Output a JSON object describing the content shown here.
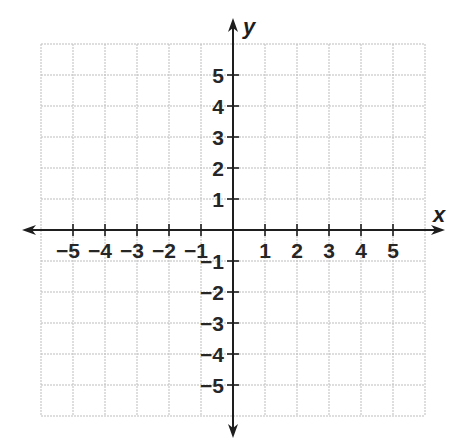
{
  "chart_data": {
    "type": "coordinate-plane",
    "title": "",
    "xlabel": "x",
    "ylabel": "y",
    "xlim": [
      -6,
      6
    ],
    "ylim": [
      -6,
      6
    ],
    "grid": true,
    "x_ticks": [
      -5,
      -4,
      -3,
      -2,
      -1,
      1,
      2,
      3,
      4,
      5
    ],
    "y_ticks": [
      -5,
      -4,
      -3,
      -2,
      -1,
      1,
      2,
      3,
      4,
      5
    ],
    "x_tick_labels": [
      "−5",
      "−4",
      "−3",
      "−2",
      "−1",
      "1",
      "2",
      "3",
      "4",
      "5"
    ],
    "y_tick_labels": [
      "−5",
      "−4",
      "−3",
      "−2",
      "−1",
      "1",
      "2",
      "3",
      "4",
      "5"
    ],
    "series": [],
    "legend": null
  },
  "layout": {
    "origin_px": [
      233,
      230
    ],
    "cell_w": 32,
    "cell_h": 31,
    "grid_cells": 6,
    "x_arrow_extent_px": [
      22,
      445
    ],
    "y_arrow_extent_px": [
      18,
      438
    ]
  },
  "colors": {
    "grid": "#bdbdbd",
    "axis": "#1e1e1e",
    "text": "#262626"
  }
}
